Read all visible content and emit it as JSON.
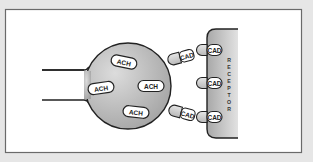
{
  "diagram": {
    "colors": {
      "background": "#e6e6e6",
      "panel": "#ffffff",
      "panel_border": "#6a6a6a",
      "outline": "#222222",
      "gray_light": "#d8d8d8",
      "gray_dark": "#9a9a9a"
    },
    "terminal": {
      "label": "",
      "vesicles": [
        {
          "label": "ACH"
        },
        {
          "label": "ACH"
        },
        {
          "label": "ACH"
        },
        {
          "label": "ACH"
        }
      ]
    },
    "free_molecules": [
      {
        "label": "CAD"
      },
      {
        "label": "CAD"
      }
    ],
    "receptor": {
      "label": "RECEPTOR",
      "letters": [
        "R",
        "E",
        "C",
        "E",
        "P",
        "T",
        "O",
        "R"
      ],
      "bound_molecules": [
        {
          "label": "CAD"
        },
        {
          "label": "CAD"
        },
        {
          "label": "CAD"
        }
      ]
    }
  }
}
